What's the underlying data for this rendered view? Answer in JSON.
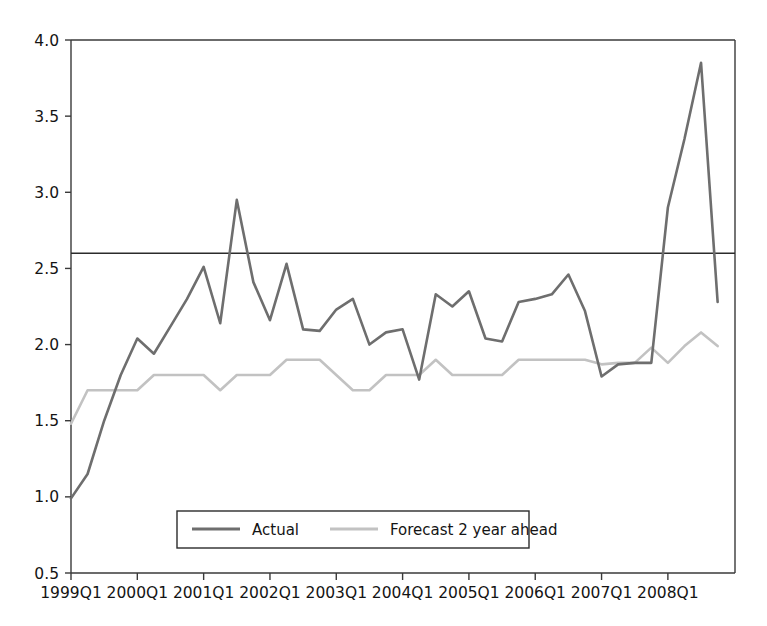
{
  "chart_data": {
    "type": "line",
    "title": "",
    "subtitle": "",
    "xlabel": "",
    "ylabel": "",
    "ylim": [
      0.5,
      4.0
    ],
    "y_ticks": [
      "0.5",
      "1.0",
      "1.5",
      "2.0",
      "2.5",
      "3.0",
      "3.5",
      "4.0"
    ],
    "y_tick_values": [
      0.5,
      1.0,
      1.5,
      2.0,
      2.5,
      3.0,
      3.5,
      4.0
    ],
    "grid": false,
    "legend_position": "bottom-center",
    "x_tick_labels": [
      "1999Q1",
      "2000Q1",
      "2001Q1",
      "2002Q1",
      "2003Q1",
      "2004Q1",
      "2005Q1",
      "2006Q1",
      "2007Q1",
      "2008Q1"
    ],
    "x_tick_quarter_index": [
      0,
      4,
      8,
      12,
      16,
      20,
      24,
      28,
      32,
      36
    ],
    "x": [
      "1999Q1",
      "1999Q2",
      "1999Q3",
      "1999Q4",
      "2000Q1",
      "2000Q2",
      "2000Q3",
      "2000Q4",
      "2001Q1",
      "2001Q2",
      "2001Q3",
      "2001Q4",
      "2002Q1",
      "2002Q2",
      "2002Q3",
      "2002Q4",
      "2003Q1",
      "2003Q2",
      "2003Q3",
      "2003Q4",
      "2004Q1",
      "2004Q2",
      "2004Q3",
      "2004Q4",
      "2005Q1",
      "2005Q2",
      "2005Q3",
      "2005Q4",
      "2006Q1",
      "2006Q2",
      "2006Q3",
      "2006Q4",
      "2007Q1",
      "2007Q2",
      "2007Q3",
      "2007Q4",
      "2008Q1",
      "2008Q2",
      "2008Q3",
      "2008Q4"
    ],
    "series": [
      {
        "name": "Actual",
        "color": "#6e6e6e",
        "values": [
          0.99,
          1.15,
          1.5,
          1.8,
          2.04,
          1.94,
          2.12,
          2.3,
          2.51,
          2.14,
          2.95,
          2.41,
          2.16,
          2.53,
          2.1,
          2.09,
          2.23,
          2.3,
          2.0,
          2.08,
          2.1,
          1.77,
          2.33,
          2.25,
          2.35,
          2.04,
          2.02,
          2.28,
          2.3,
          2.33,
          2.46,
          2.22,
          1.79,
          1.87,
          1.88,
          1.88,
          2.9,
          3.35,
          3.85,
          2.28
        ]
      },
      {
        "name": "Forecast 2 year ahead",
        "color": "#c2c2c2",
        "values": [
          1.48,
          1.7,
          1.7,
          1.7,
          1.7,
          1.8,
          1.8,
          1.8,
          1.8,
          1.7,
          1.8,
          1.8,
          1.8,
          1.9,
          1.9,
          1.9,
          1.8,
          1.7,
          1.7,
          1.8,
          1.8,
          1.8,
          1.9,
          1.8,
          1.8,
          1.8,
          1.8,
          1.9,
          1.9,
          1.9,
          1.9,
          1.9,
          1.87,
          1.88,
          1.88,
          1.98,
          1.88,
          1.99,
          2.08,
          1.99
        ]
      }
    ],
    "reference_line": {
      "name": "reference",
      "value": 2.6,
      "color": "#2b2b2b",
      "orientation": "horizontal"
    },
    "legend": [
      {
        "label": "Actual",
        "color": "#6e6e6e"
      },
      {
        "label": "Forecast 2 year ahead",
        "color": "#c2c2c2"
      }
    ]
  }
}
